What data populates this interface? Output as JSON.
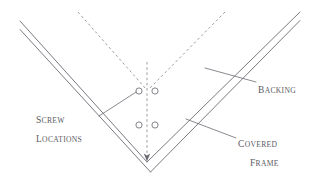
{
  "diagram": {
    "canvas": {
      "width": 313,
      "height": 175
    },
    "colors": {
      "background": "#ffffff",
      "stroke": "#6b6b73",
      "dashed_stroke": "#8a8a92",
      "text": "#5b5b63"
    },
    "labels": {
      "screw_locations": {
        "line_1_lead": "S",
        "line_1_rest": "CREW",
        "line_2_lead": "L",
        "line_2_rest": "OCATIONS"
      },
      "backing": {
        "line_1_lead": "B",
        "line_1_rest": "ACKING"
      },
      "covered_frame": {
        "line_1_lead": "C",
        "line_1_rest": "OVERED",
        "line_2_lead": "F",
        "line_2_rest": "RAME"
      }
    },
    "screws": [
      {
        "id": "screw-upper-left",
        "cx": 139,
        "cy": 91,
        "r": 3.1
      },
      {
        "id": "screw-upper-right",
        "cx": 155,
        "cy": 91,
        "r": 3.1
      },
      {
        "id": "screw-lower-left",
        "cx": 139,
        "cy": 125,
        "r": 3.1
      },
      {
        "id": "screw-lower-right",
        "cx": 155,
        "cy": 125,
        "r": 3.1
      }
    ],
    "frame_lines": {
      "left_outer": "M 20 21 L 147 162",
      "left_inner": "M 20 29 L 150 172",
      "right_outer": "M 300 12 L 147 162",
      "right_inner": "M 300 20 L 150 172"
    },
    "dashed_lines": {
      "left_diagonal": "M 78 12 L 147 90",
      "right_diagonal": "M 225 12 L 149 90",
      "center_vertical": "M 147 64 L 147 158"
    },
    "leader_lines": {
      "screw_locations": "M 99 115 L 136 92",
      "backing": "M 205 68 L 256 82",
      "covered_frame": "M 186 119 L 236 138"
    }
  }
}
